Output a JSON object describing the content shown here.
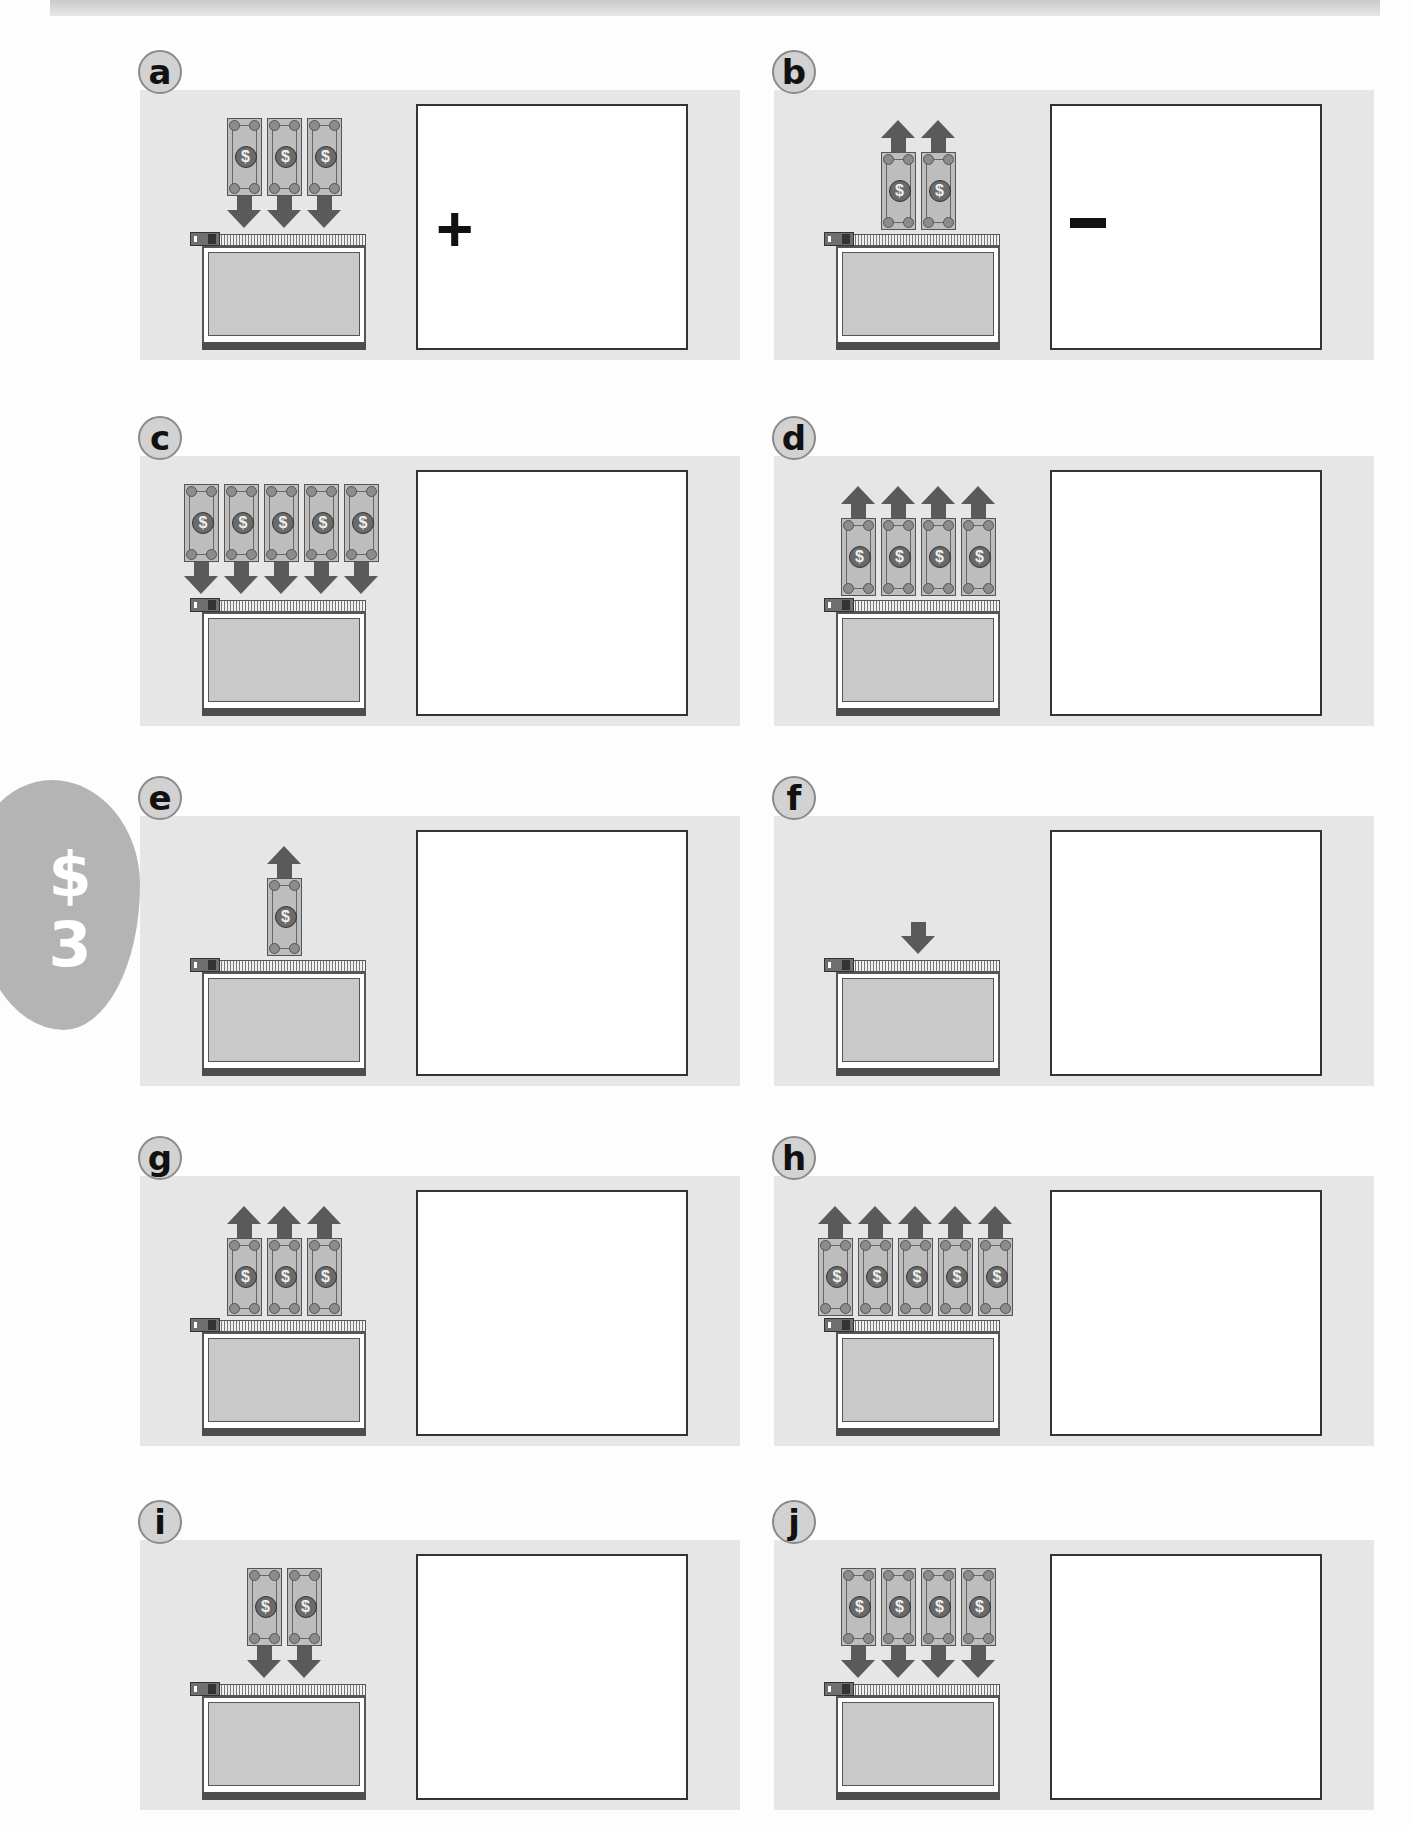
{
  "side_tab": {
    "symbol": "$",
    "number": "3",
    "color": "#b4b4b4"
  },
  "colors": {
    "panel_bg": "#e6e6e6",
    "bill": "#bdbdbd",
    "arrow": "#5a5a5a",
    "answer_border": "#333333"
  },
  "problems": [
    {
      "label": "a",
      "bills": 3,
      "direction": "in",
      "arrow": "down",
      "sign": "+",
      "answer": ""
    },
    {
      "label": "b",
      "bills": 2,
      "direction": "out",
      "arrow": "up",
      "sign": "−",
      "answer": ""
    },
    {
      "label": "c",
      "bills": 5,
      "direction": "in",
      "arrow": "down",
      "sign": "",
      "answer": ""
    },
    {
      "label": "d",
      "bills": 4,
      "direction": "out",
      "arrow": "up",
      "sign": "",
      "answer": ""
    },
    {
      "label": "e",
      "bills": 1,
      "direction": "out",
      "arrow": "up",
      "sign": "",
      "answer": ""
    },
    {
      "label": "f",
      "bills": 0,
      "direction": "in",
      "arrow": "down",
      "sign": "",
      "answer": ""
    },
    {
      "label": "g",
      "bills": 3,
      "direction": "out",
      "arrow": "up",
      "sign": "",
      "answer": ""
    },
    {
      "label": "h",
      "bills": 5,
      "direction": "out",
      "arrow": "up",
      "sign": "",
      "answer": ""
    },
    {
      "label": "i",
      "bills": 2,
      "direction": "in",
      "arrow": "down",
      "sign": "",
      "answer": ""
    },
    {
      "label": "j",
      "bills": 4,
      "direction": "in",
      "arrow": "down",
      "sign": "",
      "answer": ""
    }
  ],
  "icons": {
    "bill": "dollar-bill-icon",
    "arrow_in": "arrow-down-icon",
    "arrow_out": "arrow-up-icon",
    "wallet": "zipper-wallet-icon",
    "seal_glyph": "$"
  }
}
